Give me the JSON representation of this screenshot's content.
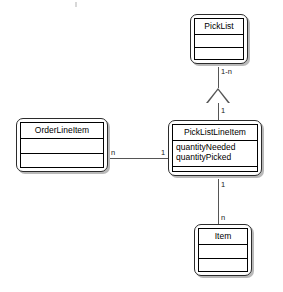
{
  "diagram": {
    "type": "uml-class-diagram",
    "classes": [
      {
        "id": "picklist",
        "name": "PickList",
        "attributes": [],
        "operations": []
      },
      {
        "id": "orderlineitem",
        "name": "OrderLineItem",
        "attributes": [],
        "operations": []
      },
      {
        "id": "picklistlineitem",
        "name": "PickListLineItem",
        "attributes": [
          "quantityNeeded",
          "quantityPicked"
        ],
        "operations": []
      },
      {
        "id": "item",
        "name": "Item",
        "attributes": [],
        "operations": []
      }
    ],
    "relationships": [
      {
        "id": "picklist-to-picklistlineitem",
        "kind": "generalization",
        "from": "PickListLineItem",
        "to": "PickList",
        "target_multiplicity": "1-n",
        "source_multiplicity": "1"
      },
      {
        "id": "orderlineitem-to-picklistlineitem",
        "kind": "association",
        "from": "OrderLineItem",
        "to": "PickListLineItem",
        "source_multiplicity": "n",
        "target_multiplicity": "1"
      },
      {
        "id": "picklistlineitem-to-item",
        "kind": "association",
        "from": "PickListLineItem",
        "to": "Item",
        "source_multiplicity": "1",
        "target_multiplicity": "n"
      }
    ],
    "labels": {
      "picklist_upper": "1-n",
      "picklist_lower": "1",
      "orderline_right": "n",
      "picklistline_left": "1",
      "picklistline_bottom": "1",
      "item_top": "n"
    },
    "colors": {
      "border": "#000000",
      "outer_frame": "#2b2b2b",
      "shadow": "#b9b9b9",
      "line": "#555555",
      "background": "#ffffff",
      "text": "#000000"
    }
  }
}
